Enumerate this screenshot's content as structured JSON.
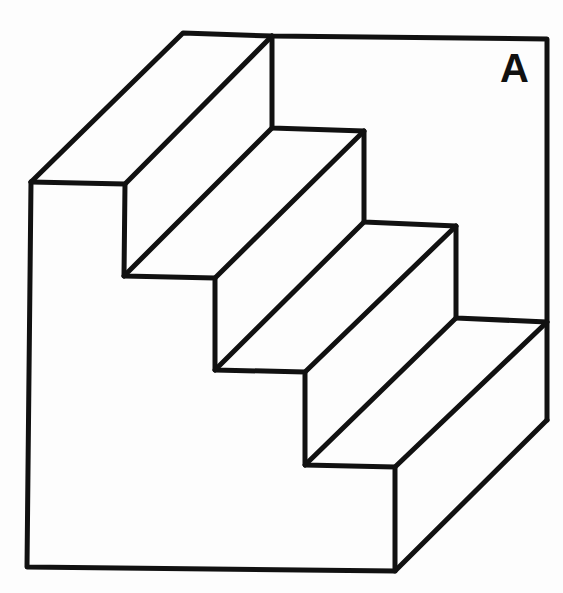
{
  "figure": {
    "title_label": "A",
    "stroke_color": "#111111",
    "background_color": "#fdfdfd",
    "steps": 4
  }
}
